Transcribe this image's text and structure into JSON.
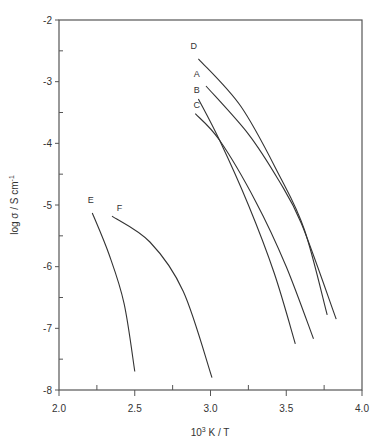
{
  "chart_data": {
    "type": "line",
    "title": "",
    "xlabel": "10^3 K / T",
    "xlabel_base": "10",
    "xlabel_sup": "3",
    "xlabel_rest": " K / T",
    "ylabel": "log σ / S cm-1",
    "ylabel_main": "log σ / S cm",
    "ylabel_sup": "-1",
    "xlim": [
      2.0,
      4.0
    ],
    "ylim": [
      -8,
      -2
    ],
    "xticks": [
      2.0,
      2.5,
      3.0,
      3.5,
      4.0
    ],
    "xtick_labels": [
      "2.0",
      "2.5",
      "3.0",
      "3.5",
      "4.0"
    ],
    "xminor": [
      2.25,
      2.75,
      3.25,
      3.75
    ],
    "yticks": [
      -2,
      -3,
      -4,
      -5,
      -6,
      -7,
      -8
    ],
    "ytick_labels": [
      "-2",
      "-3",
      "-4",
      "-5",
      "-6",
      "-7",
      "-8"
    ],
    "yminor": [
      -2.5,
      -3.5,
      -4.5,
      -5.5,
      -6.5,
      -7.5
    ],
    "grid": false,
    "legend": "inline labels at curve starts",
    "series": [
      {
        "name": "D",
        "label_pos": [
          2.89,
          -2.47
        ],
        "x": [
          2.92,
          3.2,
          3.45,
          3.62,
          3.77
        ],
        "y": [
          -2.63,
          -3.4,
          -4.5,
          -5.4,
          -6.78
        ]
      },
      {
        "name": "A",
        "label_pos": [
          2.91,
          -2.93
        ],
        "x": [
          2.97,
          3.25,
          3.45,
          3.6,
          3.83
        ],
        "y": [
          -3.07,
          -3.85,
          -4.6,
          -5.3,
          -6.85
        ]
      },
      {
        "name": "B",
        "label_pos": [
          2.91,
          -3.18
        ],
        "x": [
          2.92,
          3.06,
          3.25,
          3.42,
          3.56
        ],
        "y": [
          -3.28,
          -3.95,
          -5.0,
          -6.1,
          -7.25
        ]
      },
      {
        "name": "C",
        "label_pos": [
          2.91,
          -3.43
        ],
        "x": [
          2.9,
          3.06,
          3.3,
          3.5,
          3.68
        ],
        "y": [
          -3.52,
          -3.95,
          -4.95,
          -6.0,
          -7.17
        ]
      },
      {
        "name": "E",
        "label_pos": [
          2.21,
          -4.97
        ],
        "x": [
          2.22,
          2.33,
          2.43,
          2.5
        ],
        "y": [
          -5.13,
          -5.8,
          -6.6,
          -7.7
        ]
      },
      {
        "name": "F",
        "label_pos": [
          2.4,
          -5.1
        ],
        "x": [
          2.35,
          2.6,
          2.82,
          3.01
        ],
        "y": [
          -5.18,
          -5.6,
          -6.4,
          -7.8
        ]
      }
    ]
  },
  "colors": {
    "axis": "#555555",
    "line": "#333333",
    "text": "#333333"
  }
}
